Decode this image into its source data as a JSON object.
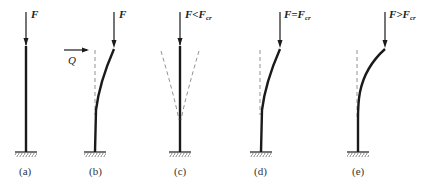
{
  "figure": {
    "panels": [
      {
        "id": "a",
        "caption": "(a)",
        "load_label": "F",
        "state": "straight, no perturbation"
      },
      {
        "id": "b",
        "caption": "(b)",
        "load_label": "F",
        "lateral_label": "Q",
        "state": "lateral force Q deflects column"
      },
      {
        "id": "c",
        "caption": "(c)",
        "load_label_main": "F<F",
        "load_label_sub": "cr",
        "state": "F less than critical, returns to straight"
      },
      {
        "id": "d",
        "caption": "(d)",
        "load_label_main": "F=F",
        "load_label_sub": "cr",
        "state": "F equals critical, neutral equilibrium in bent shape"
      },
      {
        "id": "e",
        "caption": "(e)",
        "load_label_main": "F>F",
        "load_label_sub": "cr",
        "state": "F greater than critical, buckles further"
      }
    ]
  },
  "colors": {
    "line": "#1a1a1a",
    "dashed": "#777777",
    "background": "#ffffff"
  }
}
